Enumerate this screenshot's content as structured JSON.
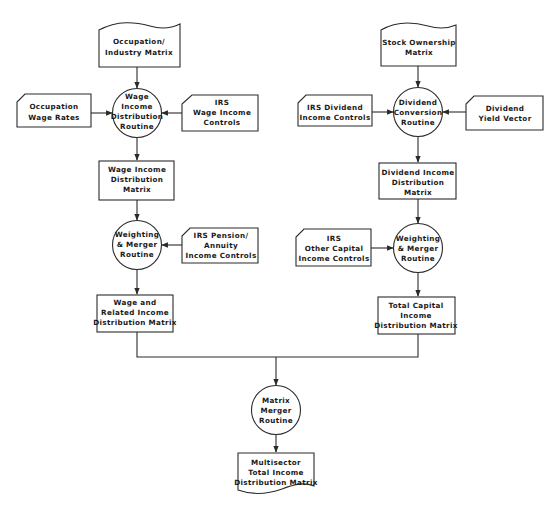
{
  "header": {
    "visible": "partially cropped section heading at top of page (illegible)"
  },
  "diagram": {
    "type": "flowchart",
    "colors": {
      "stroke": "#2a2a2a",
      "fill": "#ffffff",
      "text": "#1a1a1a"
    },
    "nodes": {
      "occupation_industry_matrix": {
        "shape": "document-wave-top",
        "lines": [
          "Occupation/",
          "Industry Matrix"
        ]
      },
      "occupation_wage_rates": {
        "shape": "card",
        "lines": [
          "Occupation",
          "Wage Rates"
        ]
      },
      "wage_income_distribution_routine": {
        "shape": "circle",
        "lines": [
          "Wage",
          "Income",
          "Distribution",
          "Routine"
        ]
      },
      "irs_wage_income_controls": {
        "shape": "card",
        "lines": [
          "IRS",
          "Wage Income",
          "Controls"
        ]
      },
      "wage_income_distribution_matrix": {
        "shape": "rect",
        "lines": [
          "Wage Income",
          "Distribution",
          "Matrix"
        ]
      },
      "weighting_merger_routine_left": {
        "shape": "circle",
        "lines": [
          "Weighting",
          "& Merger",
          "Routine"
        ]
      },
      "irs_pension_annuity_controls": {
        "shape": "card",
        "lines": [
          "IRS Pension/",
          "Annuity",
          "Income Controls"
        ]
      },
      "wage_related_income_matrix": {
        "shape": "rect",
        "lines": [
          "Wage and",
          "Related Income",
          "Distribution Matrix"
        ]
      },
      "stock_ownership_matrix": {
        "shape": "document-wave-top",
        "lines": [
          "Stock Ownership",
          "Matrix"
        ]
      },
      "irs_dividend_income_controls": {
        "shape": "card",
        "lines": [
          "IRS Dividend",
          "Income Controls"
        ]
      },
      "dividend_conversion_routine": {
        "shape": "circle",
        "lines": [
          "Dividend",
          "Conversion",
          "Routine"
        ]
      },
      "dividend_yield_vector": {
        "shape": "card",
        "lines": [
          "Dividend",
          "Yield Vector"
        ]
      },
      "dividend_income_distribution_matrix": {
        "shape": "rect",
        "lines": [
          "Dividend Income",
          "Distribution",
          "Matrix"
        ]
      },
      "irs_other_capital_income_controls": {
        "shape": "card",
        "lines": [
          "IRS",
          "Other Capital",
          "Income Controls"
        ]
      },
      "weighting_merger_routine_right": {
        "shape": "circle",
        "lines": [
          "Weighting",
          "& Merger",
          "Routine"
        ]
      },
      "total_capital_income_matrix": {
        "shape": "rect",
        "lines": [
          "Total Capital",
          "Income",
          "Distribution Matrix"
        ]
      },
      "matrix_merger_routine": {
        "shape": "circle",
        "lines": [
          "Matrix",
          "Merger",
          "Routine"
        ]
      },
      "multisector_total_income_matrix": {
        "shape": "document-wave-bottom",
        "lines": [
          "Multisector",
          "Total Income",
          "Distribution Matrix"
        ]
      }
    },
    "edges": [
      {
        "from": "occupation_industry_matrix",
        "to": "wage_income_distribution_routine"
      },
      {
        "from": "occupation_wage_rates",
        "to": "wage_income_distribution_routine"
      },
      {
        "from": "irs_wage_income_controls",
        "to": "wage_income_distribution_routine"
      },
      {
        "from": "wage_income_distribution_routine",
        "to": "wage_income_distribution_matrix"
      },
      {
        "from": "wage_income_distribution_matrix",
        "to": "weighting_merger_routine_left"
      },
      {
        "from": "irs_pension_annuity_controls",
        "to": "weighting_merger_routine_left"
      },
      {
        "from": "weighting_merger_routine_left",
        "to": "wage_related_income_matrix"
      },
      {
        "from": "stock_ownership_matrix",
        "to": "dividend_conversion_routine"
      },
      {
        "from": "irs_dividend_income_controls",
        "to": "dividend_conversion_routine"
      },
      {
        "from": "dividend_yield_vector",
        "to": "dividend_conversion_routine"
      },
      {
        "from": "dividend_conversion_routine",
        "to": "dividend_income_distribution_matrix"
      },
      {
        "from": "dividend_income_distribution_matrix",
        "to": "weighting_merger_routine_right"
      },
      {
        "from": "irs_other_capital_income_controls",
        "to": "weighting_merger_routine_right"
      },
      {
        "from": "weighting_merger_routine_right",
        "to": "total_capital_income_matrix"
      },
      {
        "from": "wage_related_income_matrix",
        "to": "matrix_merger_routine"
      },
      {
        "from": "total_capital_income_matrix",
        "to": "matrix_merger_routine"
      },
      {
        "from": "matrix_merger_routine",
        "to": "multisector_total_income_matrix"
      }
    ]
  }
}
